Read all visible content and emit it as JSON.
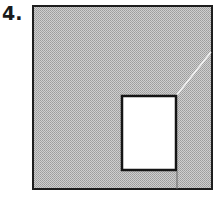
{
  "problem": {
    "number_label": "4."
  },
  "figure": {
    "outer_square": {
      "x": 33,
      "y": 6,
      "width": 179,
      "height": 183,
      "fill": "#b8b8b8",
      "stroke": "#1e1e1e"
    },
    "inner_rectangle": {
      "x": 122,
      "y": 96,
      "width": 54,
      "height": 74,
      "fill": "#ffffff",
      "stroke": "#151515"
    },
    "diagonal_line": {
      "x1": 211,
      "y1": 52,
      "x2": 176,
      "y2": 96,
      "color": "#f2f2f2"
    },
    "vertical_line": {
      "x1": 177,
      "y1": 170,
      "x2": 177,
      "y2": 189,
      "color": "#555555"
    },
    "hatch_color_light": "#d6d6d6",
    "hatch_color_dark": "#9a9a9a"
  }
}
